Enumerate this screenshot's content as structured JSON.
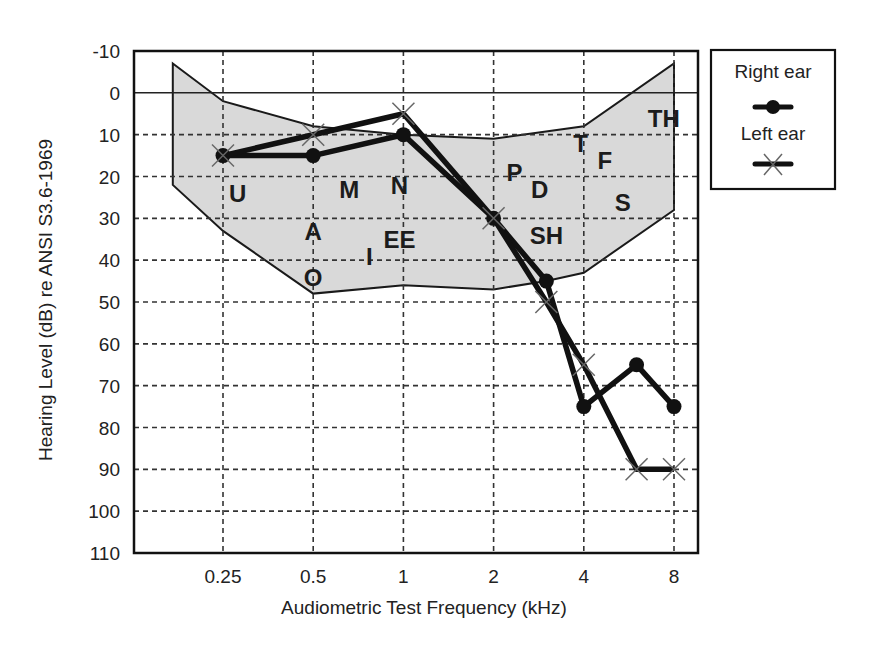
{
  "chart_data": {
    "type": "line",
    "title": "",
    "xlabel": "Audiometric Test Frequency (kHz)",
    "ylabel": "Hearing Level (dB) re ANSI S3.6-1969",
    "x_scale": "log2",
    "y_inverted": true,
    "ylim": [
      -10,
      110
    ],
    "y_ticks": [
      -10,
      0,
      10,
      20,
      30,
      40,
      50,
      60,
      70,
      80,
      90,
      100,
      110
    ],
    "x_ticks": [
      {
        "value": 0.25,
        "label": "0.25"
      },
      {
        "value": 0.5,
        "label": "0.5"
      },
      {
        "value": 1,
        "label": "1"
      },
      {
        "value": 2,
        "label": "2"
      },
      {
        "value": 4,
        "label": "4"
      },
      {
        "value": 8,
        "label": "8"
      }
    ],
    "grid": true,
    "reference_line_db": 0,
    "legend_position": "right",
    "series": [
      {
        "name": "Right ear",
        "marker": "filled-circle",
        "x": [
          0.25,
          0.5,
          1,
          2,
          3,
          4,
          6,
          8
        ],
        "values": [
          15,
          15,
          10,
          30,
          45,
          75,
          65,
          75
        ]
      },
      {
        "name": "Left ear",
        "marker": "x",
        "x": [
          0.25,
          0.5,
          1,
          2,
          3,
          4,
          6,
          8
        ],
        "values": [
          15,
          10,
          5,
          30,
          50,
          65,
          90,
          90
        ]
      }
    ],
    "speech_banana": {
      "label": "speech sound region",
      "fill": "#d9d9d9",
      "outline": [
        [
          0.17,
          -7
        ],
        [
          0.25,
          2
        ],
        [
          0.5,
          8
        ],
        [
          1,
          10
        ],
        [
          2,
          11
        ],
        [
          4,
          8
        ],
        [
          8,
          -7
        ],
        [
          8,
          28
        ],
        [
          4,
          43
        ],
        [
          3,
          45
        ],
        [
          2,
          47
        ],
        [
          1,
          46
        ],
        [
          0.5,
          48
        ],
        [
          0.25,
          33
        ],
        [
          0.17,
          22
        ]
      ]
    },
    "phonemes": [
      {
        "text": "U",
        "x": 0.28,
        "db": 24
      },
      {
        "text": "M",
        "x": 0.66,
        "db": 23
      },
      {
        "text": "N",
        "x": 0.97,
        "db": 22
      },
      {
        "text": "A",
        "x": 0.5,
        "db": 33
      },
      {
        "text": "EE",
        "x": 0.97,
        "db": 35
      },
      {
        "text": "I",
        "x": 0.77,
        "db": 39
      },
      {
        "text": "O",
        "x": 0.5,
        "db": 44
      },
      {
        "text": "P",
        "x": 2.35,
        "db": 19
      },
      {
        "text": "D",
        "x": 2.85,
        "db": 23
      },
      {
        "text": "SH",
        "x": 3.0,
        "db": 34
      },
      {
        "text": "T",
        "x": 3.9,
        "db": 12
      },
      {
        "text": "F",
        "x": 4.7,
        "db": 16
      },
      {
        "text": "S",
        "x": 5.4,
        "db": 26
      },
      {
        "text": "TH",
        "x": 7.4,
        "db": 6
      }
    ],
    "colors": {
      "line": "#111111",
      "grid": "#333333",
      "band_fill": "#d9d9d9",
      "x_marker": "#666666"
    }
  },
  "legend": {
    "right_ear_label": "Right ear",
    "left_ear_label": "Left ear"
  }
}
